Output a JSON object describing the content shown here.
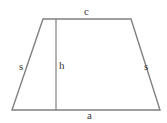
{
  "figure": {
    "type": "trapezoid-diagram",
    "stroke_color": "#808080",
    "label_color": "#3a3a3a",
    "background_color": "#ffffff",
    "canvas": {
      "width": 167,
      "height": 123
    },
    "vertices": {
      "top_left": {
        "x": 43,
        "y": 19
      },
      "top_right": {
        "x": 131,
        "y": 19
      },
      "bottom_right": {
        "x": 160,
        "y": 110
      },
      "bottom_left": {
        "x": 12,
        "y": 110
      }
    },
    "height_line": {
      "name": "height-segment",
      "x": 56,
      "y_top": 19,
      "y_bottom": 110
    },
    "labels": {
      "top_side": "c",
      "bottom_side": "a",
      "height": "h",
      "left_side": "s",
      "right_side": "s"
    }
  }
}
